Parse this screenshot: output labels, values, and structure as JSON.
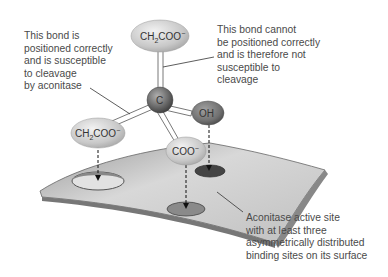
{
  "diagram": {
    "molecule": {
      "center_atom": "C",
      "top_group": {
        "main": "CH",
        "sub": "2",
        "rest": "COO",
        "sup": "−"
      },
      "left_group": {
        "main": "CH",
        "sub": "2",
        "rest": "COO",
        "sup": "−"
      },
      "bottom_group": {
        "main": "COO",
        "sup": "−"
      },
      "right_group": "OH"
    },
    "annotations": {
      "left_bond": "This bond is\npositioned correctly\nand is susceptible\nto cleavage\nby aconitase",
      "top_bond": "This bond cannot\nbe positioned correctly\nand is therefore not\nsusceptible to\ncleavage",
      "active_site": "Aconitase active site\nwith at least three\nasymmetrically distributed\nbinding sites on its surface"
    },
    "colors": {
      "group_fill": "#cfcfcf",
      "oh_fill": "#7a7a7a",
      "carbon_fill": "#6e6e6e",
      "surface_fill": "#d4d4d4",
      "text": "#4a4a4a"
    }
  }
}
